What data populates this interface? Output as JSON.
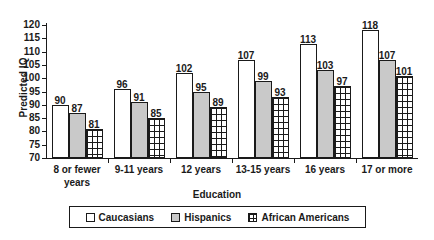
{
  "chart_data": {
    "type": "bar",
    "title": "",
    "xlabel": "Education",
    "ylabel": "Predicted IQ",
    "ylim": [
      70,
      120
    ],
    "ytick_step": 5,
    "yticks": [
      120,
      115,
      110,
      105,
      100,
      95,
      90,
      85,
      80,
      75,
      70
    ],
    "grid": false,
    "legend_position": "bottom",
    "categories": [
      "8 or fewer years",
      "9-11 years",
      "12 years",
      "13-15 years",
      "16 years",
      "17 or more"
    ],
    "series": [
      {
        "name": "Caucasians",
        "values": [
          90,
          96,
          102,
          107,
          113,
          118
        ],
        "color": "#ffffff",
        "pattern": "solid-white"
      },
      {
        "name": "Hispanics",
        "values": [
          87,
          91,
          95,
          99,
          103,
          107
        ],
        "color": "#c9c9c9",
        "pattern": "solid-gray"
      },
      {
        "name": "African Americans",
        "values": [
          81,
          85,
          89,
          93,
          97,
          101
        ],
        "color": "#ffffff",
        "pattern": "grid-hatch"
      }
    ]
  },
  "axis": {
    "y_title": "Predicted IQ",
    "x_title": "Education"
  },
  "colors": {
    "ink": "#1a1a1a",
    "series_gray": "#c9c9c9",
    "background": "#ffffff"
  }
}
